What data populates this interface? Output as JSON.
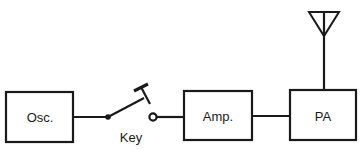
{
  "diagram": {
    "title": "",
    "type": "block-diagram",
    "blocks": [
      {
        "id": "osc",
        "label": "Osc."
      },
      {
        "id": "amp",
        "label": "Amp."
      },
      {
        "id": "pa",
        "label": "PA"
      }
    ],
    "switch": {
      "id": "key",
      "label": "Key",
      "state": "open"
    },
    "antenna": {
      "id": "antenna",
      "attached_to": "pa"
    },
    "connections": [
      {
        "from": "osc",
        "to": "key"
      },
      {
        "from": "key",
        "to": "amp"
      },
      {
        "from": "amp",
        "to": "pa"
      },
      {
        "from": "pa",
        "to": "antenna"
      }
    ],
    "colors": {
      "stroke": "#1a1a1a",
      "background": "#ffffff"
    }
  }
}
